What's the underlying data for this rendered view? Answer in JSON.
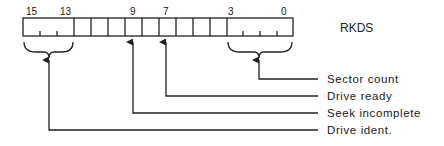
{
  "register": {
    "name": "RKDS",
    "bit_labels": [
      {
        "text": "15",
        "x": 30
      },
      {
        "text": "13",
        "x": 64
      },
      {
        "text": "9",
        "x": 133
      },
      {
        "text": "7",
        "x": 166
      },
      {
        "text": "3",
        "x": 231
      },
      {
        "text": "0",
        "x": 284
      }
    ]
  },
  "fields": [
    {
      "label": "Sector count",
      "bits": "3-0"
    },
    {
      "label": "Drive ready",
      "bits": "7"
    },
    {
      "label": "Seek incomplete",
      "bits": "9"
    },
    {
      "label": "Drive ident.",
      "bits": "15-13"
    }
  ],
  "colors": {
    "line": "#222222",
    "background": "#ffffff"
  }
}
